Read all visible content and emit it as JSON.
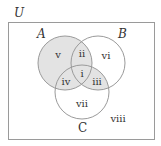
{
  "diagram": {
    "type": "venn",
    "universe_label": "U",
    "sets": [
      {
        "name": "A",
        "cx": 65,
        "cy": 63,
        "r": 27
      },
      {
        "name": "B",
        "cx": 98,
        "cy": 63,
        "r": 27
      },
      {
        "name": "C",
        "cx": 82,
        "cy": 92,
        "r": 27
      }
    ],
    "shaded_regions": [
      "v",
      "ii",
      "i",
      "iv",
      "iii"
    ],
    "shade_color": "#e3e3e3",
    "stroke_color": "#9a9a9a",
    "regions": [
      {
        "label": "i",
        "x": 82,
        "y": 75
      },
      {
        "label": "ii",
        "x": 82,
        "y": 53
      },
      {
        "label": "iii",
        "x": 96,
        "y": 82
      },
      {
        "label": "iv",
        "x": 66,
        "y": 82
      },
      {
        "label": "v",
        "x": 58,
        "y": 56
      },
      {
        "label": "vi",
        "x": 106,
        "y": 56
      },
      {
        "label": "vii",
        "x": 82,
        "y": 105
      },
      {
        "label": "viii",
        "x": 118,
        "y": 119
      }
    ],
    "labels": {
      "U": "U",
      "A": "A",
      "B": "B",
      "C": "C",
      "i": "i",
      "ii": "ii",
      "iii": "iii",
      "iv": "iv",
      "v": "v",
      "vi": "vi",
      "vii": "vii",
      "viii": "viii"
    }
  }
}
